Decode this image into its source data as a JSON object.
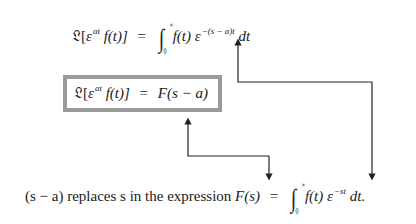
{
  "equations": {
    "top": {
      "lhs_operator": "𝔏[",
      "lhs_base": "ε",
      "lhs_exp": "at",
      "lhs_fn": " f(t)]",
      "equals": "=",
      "integral_upper": "∞",
      "integral_lower": "0",
      "integrand_fn": "f(t) ε",
      "integrand_exp": "−(s − a)t",
      "differential": "dt"
    },
    "boxed": {
      "lhs_operator": "𝔏[",
      "lhs_base": "ε",
      "lhs_exp": "at",
      "lhs_fn": " f(t)]",
      "equals": "=",
      "rhs": "F(s − a)"
    },
    "bottom": {
      "text_prefix": "(s − a) replaces s in the expression",
      "lhs": "F(s)",
      "equals": "=",
      "integral_upper": "∞",
      "integral_lower": "0",
      "integrand_fn": "f(t) ε",
      "integrand_exp": "−st",
      "differential": "dt."
    }
  },
  "colors": {
    "box_border": "#9a9a9a",
    "arrow": "#222222",
    "text": "#1a1a1a"
  }
}
